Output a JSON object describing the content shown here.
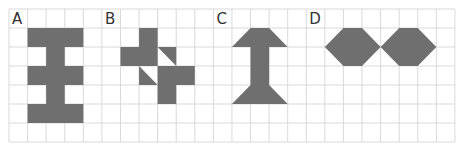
{
  "grid": {
    "x0": 9,
    "y0": 9,
    "cols": 24,
    "rows": 7,
    "cell_w": 18.58,
    "cell_h": 19,
    "line_color": "#d9d9d9"
  },
  "colors": {
    "shape_fill": "#6f6f6f",
    "label": "#333333",
    "background": "#ffffff"
  },
  "panels": [
    {
      "label": "A",
      "label_col": 0,
      "shapes": [
        {
          "type": "rect",
          "col": 1,
          "row": 1,
          "w": 3,
          "h": 1
        },
        {
          "type": "rect",
          "col": 2,
          "row": 2,
          "w": 1,
          "h": 1
        },
        {
          "type": "rect",
          "col": 1,
          "row": 3,
          "w": 3,
          "h": 1
        },
        {
          "type": "rect",
          "col": 2,
          "row": 4,
          "w": 1,
          "h": 1
        },
        {
          "type": "rect",
          "col": 1,
          "row": 5,
          "w": 3,
          "h": 1
        }
      ]
    },
    {
      "label": "B",
      "label_col": 5,
      "shapes": [
        {
          "type": "rect",
          "col": 7,
          "row": 1,
          "w": 1,
          "h": 1
        },
        {
          "type": "rect",
          "col": 6,
          "row": 2,
          "w": 2,
          "h": 1
        },
        {
          "type": "poly",
          "pts": [
            [
              8,
              2
            ],
            [
              9,
              2
            ],
            [
              9,
              3
            ]
          ]
        },
        {
          "type": "poly",
          "pts": [
            [
              7,
              3
            ],
            [
              7,
              4
            ],
            [
              8,
              4
            ]
          ]
        },
        {
          "type": "rect",
          "col": 8,
          "row": 3,
          "w": 2,
          "h": 1
        },
        {
          "type": "rect",
          "col": 8,
          "row": 4,
          "w": 1,
          "h": 1
        }
      ]
    },
    {
      "label": "C",
      "label_col": 11,
      "shapes": [
        {
          "type": "poly",
          "pts": [
            [
              13,
              1
            ],
            [
              14,
              1
            ],
            [
              15,
              2
            ],
            [
              12,
              2
            ]
          ]
        },
        {
          "type": "rect",
          "col": 13,
          "row": 2,
          "w": 1,
          "h": 2
        },
        {
          "type": "poly",
          "pts": [
            [
              13,
              4
            ],
            [
              14,
              4
            ],
            [
              15,
              5
            ],
            [
              12,
              5
            ]
          ]
        }
      ]
    },
    {
      "label": "D",
      "label_col": 16,
      "shapes": [
        {
          "type": "poly",
          "pts": [
            [
              17,
              2
            ],
            [
              18,
              1
            ],
            [
              19,
              1
            ],
            [
              20,
              2
            ],
            [
              19,
              3
            ],
            [
              18,
              3
            ]
          ]
        },
        {
          "type": "poly",
          "pts": [
            [
              20,
              2
            ],
            [
              21,
              1
            ],
            [
              22,
              1
            ],
            [
              23,
              2
            ],
            [
              22,
              3
            ],
            [
              21,
              3
            ]
          ]
        }
      ]
    }
  ]
}
